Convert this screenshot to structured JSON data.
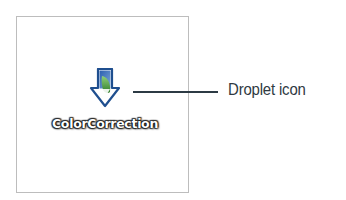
{
  "droplet": {
    "label": "ColorCorrection",
    "icon": "droplet-arrow-icon"
  },
  "callout": {
    "text": "Droplet icon"
  },
  "colors": {
    "arrow_fill": "#3f6fb5",
    "arrow_outline": "#1f4f8f",
    "feather": "#4a9a3c",
    "line": "#2c3a44",
    "frame_border": "#bdbdbd"
  }
}
